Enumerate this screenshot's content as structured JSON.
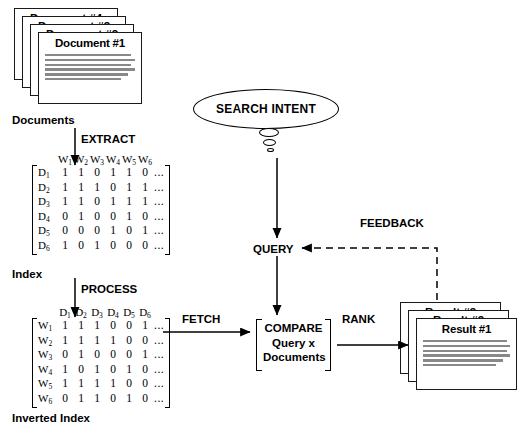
{
  "diagram": {
    "documents_stack": {
      "front_title": "Document #1",
      "ghost_titles": [
        "Document #4",
        "Document #3",
        "Document #2"
      ],
      "body_line_count": 6,
      "caption": "Documents"
    },
    "results_stack": {
      "front_title": "Result #1",
      "ghost_titles": [
        "Result #3",
        "Result #2"
      ],
      "body_line_count": 6
    },
    "search_intent": {
      "label": "SEARCH INTENT",
      "bubble_count": 3
    },
    "query": {
      "label": "QUERY"
    },
    "compare": {
      "line1": "COMPARE",
      "line2": "Query x",
      "line3": "Documents"
    },
    "arrows": {
      "extract": "EXTRACT",
      "process": "PROCESS",
      "fetch": "FETCH",
      "rank": "RANK",
      "feedback": "FEEDBACK"
    },
    "captions": {
      "documents": "Documents",
      "index": "Index",
      "inverted_index": "Inverted Index"
    },
    "index_matrix": {
      "caption": "Index",
      "column_headers": [
        "W1",
        "W2",
        "W3",
        "W4",
        "W5",
        "W6"
      ],
      "row_labels": [
        "D1",
        "D2",
        "D3",
        "D4",
        "D5",
        "D6"
      ],
      "ellipsis": "...",
      "rows": [
        [
          1,
          1,
          0,
          1,
          1,
          0
        ],
        [
          1,
          1,
          1,
          0,
          1,
          1
        ],
        [
          1,
          1,
          0,
          1,
          1,
          1
        ],
        [
          0,
          1,
          0,
          0,
          1,
          0
        ],
        [
          0,
          0,
          0,
          1,
          0,
          1
        ],
        [
          1,
          0,
          1,
          0,
          0,
          0
        ]
      ]
    },
    "inverted_index_matrix": {
      "caption": "Inverted Index",
      "column_headers": [
        "D1",
        "D2",
        "D3",
        "D4",
        "D5",
        "D6"
      ],
      "row_labels": [
        "W1",
        "W2",
        "W3",
        "W4",
        "W5",
        "W6"
      ],
      "ellipsis": "...",
      "rows": [
        [
          1,
          1,
          1,
          0,
          0,
          1
        ],
        [
          1,
          1,
          1,
          1,
          0,
          0
        ],
        [
          0,
          1,
          0,
          0,
          0,
          1
        ],
        [
          1,
          0,
          1,
          0,
          1,
          0
        ],
        [
          1,
          1,
          1,
          1,
          0,
          0
        ],
        [
          0,
          1,
          1,
          0,
          1,
          0
        ]
      ]
    },
    "colors": {
      "ink": "#000000",
      "background": "#ffffff",
      "body_text_line": "#6e6e6e"
    }
  }
}
